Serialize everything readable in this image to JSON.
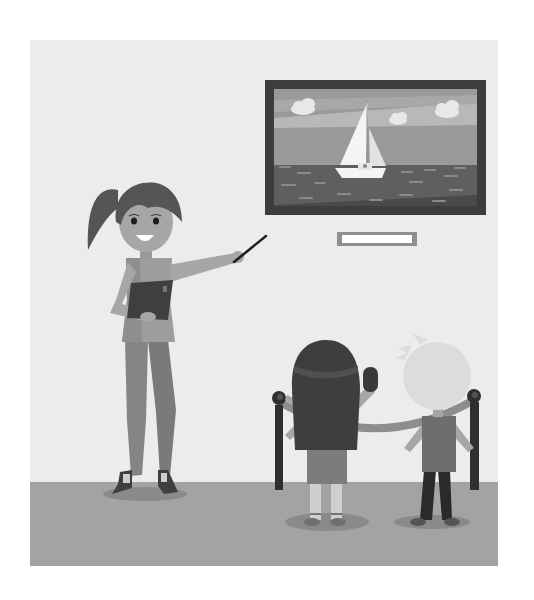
{
  "image": {
    "description": "Flat vector illustration of a woman presenting a framed sailboat painting in a gallery to two children standing behind a rope barrier",
    "palette": {
      "background": "#ffffff",
      "wall": "#ececec",
      "floor": "#a3a3a3",
      "frame": "#3d3d3d",
      "sky": "#9a9a9a",
      "sky_band": "#b4b4b4",
      "sea": "#5f5f5f",
      "sail": "#f4f4f4",
      "plaque_border": "#8f8f8f",
      "plaque_fill": "#ffffff",
      "skin": "#a6a6a6",
      "teacher_hair": "#555555",
      "teacher_top": "#9d9d9d",
      "teacher_pants": "#858585",
      "book": "#3f3f3f",
      "girl_hair": "#3e3e3e",
      "girl_skirt": "#7c7c7c",
      "boy_hair": "#dcdcdc",
      "boy_shirt": "#6e6e6e",
      "boy_pants": "#2a2a2a",
      "stanchion": "#2f2f2f",
      "rope": "#8d8d8d",
      "shadow": "#8a8a8a"
    }
  },
  "painting": {
    "subject": "sailboat-at-sea",
    "clouds": 3,
    "plaque_text": ""
  },
  "figures": {
    "teacher": {
      "holding": "book",
      "pointing_with": "pointer"
    },
    "children": [
      "girl",
      "boy"
    ],
    "girl_holding": "phone"
  }
}
